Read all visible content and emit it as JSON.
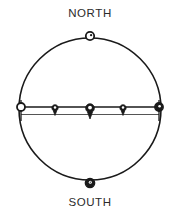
{
  "diagram": {
    "type": "celestial-sphere",
    "title_north": "NORTH",
    "title_south": "SOUTH",
    "background_color": "#ffffff",
    "stroke_color": "#1a1a1a",
    "fill_marker_color": "#1a1a1a",
    "open_marker_fill": "#ffffff",
    "sphere": {
      "center_x": 90,
      "center_y": 109,
      "radius": 71,
      "stroke_width": 1.6
    },
    "band": {
      "name": "equatorial-band",
      "upper_line_y": 107,
      "lower_line_y": 114.5,
      "left_x": 19,
      "right_x": 161,
      "stroke_width": 1.4
    },
    "pole_markers": [
      {
        "name": "north-pole-marker",
        "style": "open",
        "cx": 90,
        "cy": 36,
        "r": 4.2
      },
      {
        "name": "south-pole-marker",
        "style": "filled",
        "cx": 90,
        "cy": 183,
        "r": 4.6
      }
    ],
    "band_end_markers": [
      {
        "name": "west-end-marker",
        "style": "open",
        "cx": 21,
        "cy": 107,
        "r": 4.0
      },
      {
        "name": "east-end-marker",
        "style": "filled",
        "cx": 159,
        "cy": 107,
        "r": 4.2
      }
    ],
    "band_pin_markers": [
      {
        "name": "band-pin-marker-1",
        "style": "filled",
        "cx": 55,
        "cy": 108,
        "head_r": 3.2,
        "tail_length": 7
      },
      {
        "name": "band-pin-marker-2",
        "style": "filled",
        "cx": 90,
        "cy": 108,
        "head_r": 4.4,
        "tail_length": 9
      },
      {
        "name": "band-pin-marker-3",
        "style": "filled",
        "cx": 123,
        "cy": 108,
        "head_r": 3.2,
        "tail_length": 7
      }
    ]
  }
}
